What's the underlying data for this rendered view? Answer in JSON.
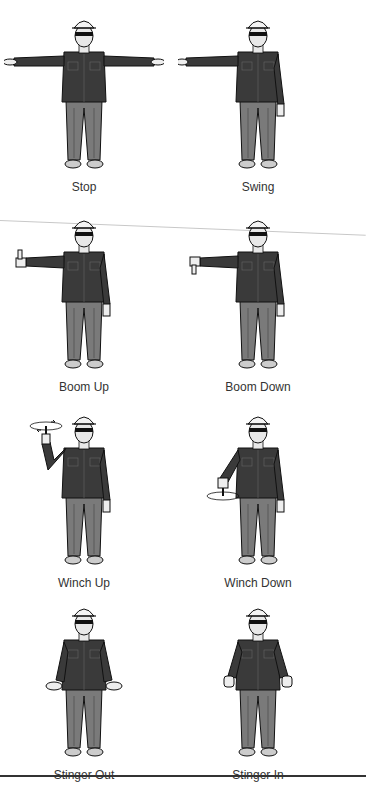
{
  "colors": {
    "shirt": "#3a3a3a",
    "pants": "#7a7a7a",
    "skin": "#e8e8e8",
    "outline": "#111111",
    "rule": "#333333"
  },
  "signals": [
    {
      "label": "Stop",
      "pose": "both-arms-extended-horizontal-palms-down"
    },
    {
      "label": "Swing",
      "pose": "one-arm-extended-pointing"
    },
    {
      "label": "Boom Up",
      "pose": "arm-extended-thumb-up"
    },
    {
      "label": "Boom Down",
      "pose": "arm-extended-thumb-down"
    },
    {
      "label": "Winch Up",
      "pose": "forearm-raised-finger-up-circular-motion"
    },
    {
      "label": "Winch Down",
      "pose": "arm-lowered-finger-down-circular-motion"
    },
    {
      "label": "Stinger Out",
      "pose": "arms-down-hands-out-thumbs-outward"
    },
    {
      "label": "Stinger In",
      "pose": "arms-down-fists-thumbs-inward"
    }
  ]
}
